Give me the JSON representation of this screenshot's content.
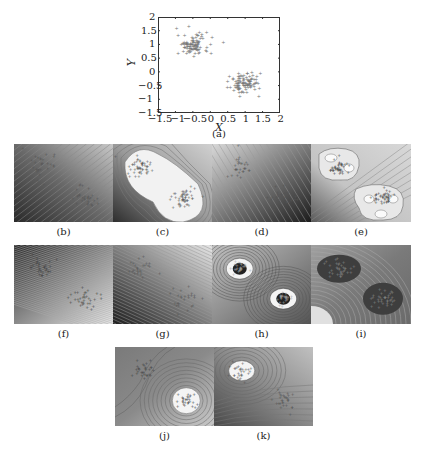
{
  "figure": {
    "panel_a": {
      "caption": "(a)",
      "xlabel": "X",
      "ylabel": "Y",
      "xticks": [
        "-1.5",
        "-1",
        "-0.5",
        "0",
        "0.5",
        "1",
        "1.5",
        "2"
      ],
      "yticks": [
        "2",
        "1.5",
        "1",
        "0.5",
        "0",
        "-0.5",
        "-1",
        "-1.5"
      ]
    },
    "captions": [
      "(b)",
      "(c)",
      "(d)",
      "(e)",
      "(f)",
      "(g)",
      "(h)",
      "(i)",
      "(j)",
      "(k)"
    ]
  },
  "chart_data": {
    "type": "scatter",
    "title": "",
    "xlabel": "X",
    "ylabel": "Y",
    "xlim": [
      -1.5,
      2
    ],
    "ylim": [
      -1.5,
      2
    ],
    "grid": false,
    "series": [
      {
        "name": "cluster 1",
        "center": [
          -0.5,
          1.0
        ],
        "spread": 0.25,
        "approx_points": 100
      },
      {
        "name": "cluster 2",
        "center": [
          1.0,
          -0.4
        ],
        "spread": 0.25,
        "approx_points": 100
      }
    ]
  }
}
